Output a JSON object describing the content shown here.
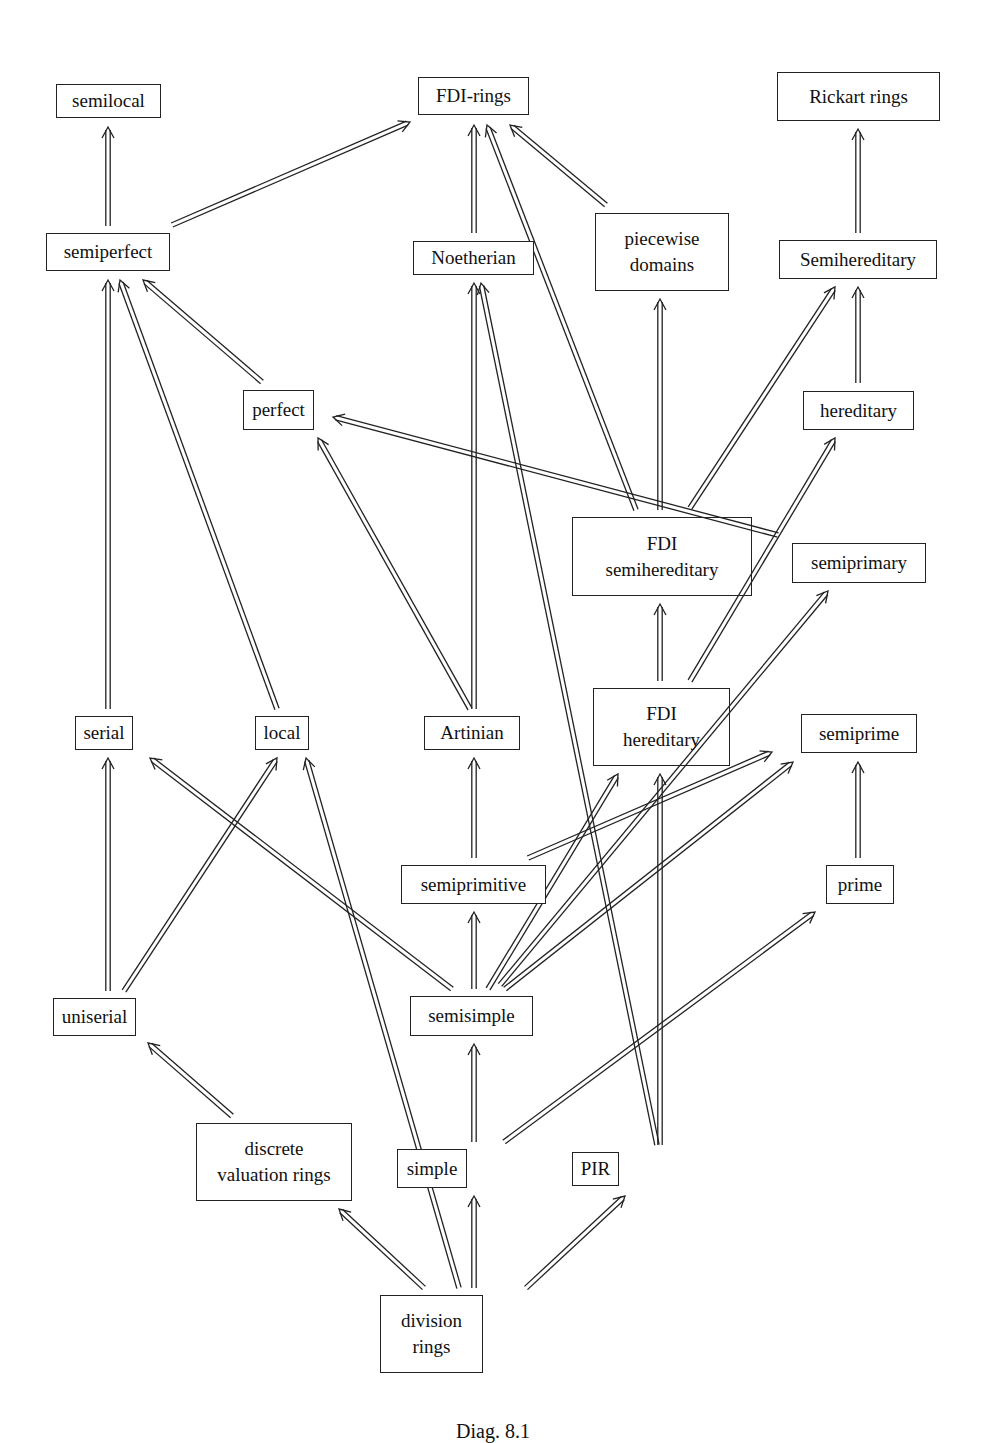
{
  "diagram": {
    "caption": "Diag. 8.1",
    "colors": {
      "stroke": "#222222",
      "background": "#ffffff"
    },
    "nodes": [
      {
        "id": "semilocal",
        "lines": [
          "semilocal"
        ],
        "x": 56,
        "y": 84,
        "w": 105,
        "h": 34
      },
      {
        "id": "fdi_rings",
        "lines": [
          "FDI-rings"
        ],
        "x": 418,
        "y": 77,
        "w": 111,
        "h": 38
      },
      {
        "id": "rickart",
        "lines": [
          "Rickart rings"
        ],
        "x": 777,
        "y": 72,
        "w": 163,
        "h": 49
      },
      {
        "id": "semiperfect",
        "lines": [
          "semiperfect"
        ],
        "x": 46,
        "y": 233,
        "w": 124,
        "h": 38
      },
      {
        "id": "noetherian",
        "lines": [
          "Noetherian"
        ],
        "x": 413,
        "y": 241,
        "w": 121,
        "h": 34
      },
      {
        "id": "piecewise",
        "lines": [
          "piecewise",
          "domains"
        ],
        "x": 595,
        "y": 213,
        "w": 134,
        "h": 78
      },
      {
        "id": "semihereditary",
        "lines": [
          "Semihereditary"
        ],
        "x": 779,
        "y": 240,
        "w": 158,
        "h": 39
      },
      {
        "id": "perfect",
        "lines": [
          "perfect"
        ],
        "x": 243,
        "y": 390,
        "w": 71,
        "h": 40
      },
      {
        "id": "hereditary",
        "lines": [
          "hereditary"
        ],
        "x": 803,
        "y": 391,
        "w": 111,
        "h": 39
      },
      {
        "id": "fdi_semihereditary",
        "lines": [
          "FDI",
          "semihereditary"
        ],
        "x": 572,
        "y": 517,
        "w": 180,
        "h": 79,
        "transparent": true
      },
      {
        "id": "semiprimary",
        "lines": [
          "semiprimary"
        ],
        "x": 792,
        "y": 543,
        "w": 134,
        "h": 40
      },
      {
        "id": "serial",
        "lines": [
          "serial"
        ],
        "x": 75,
        "y": 716,
        "w": 58,
        "h": 34
      },
      {
        "id": "local",
        "lines": [
          "local"
        ],
        "x": 255,
        "y": 716,
        "w": 54,
        "h": 34
      },
      {
        "id": "artinian",
        "lines": [
          "Artinian"
        ],
        "x": 424,
        "y": 716,
        "w": 96,
        "h": 34
      },
      {
        "id": "fdi_hereditary",
        "lines": [
          "FDI",
          "hereditary"
        ],
        "x": 593,
        "y": 688,
        "w": 137,
        "h": 78,
        "transparent": true
      },
      {
        "id": "semiprime",
        "lines": [
          "semiprime"
        ],
        "x": 801,
        "y": 714,
        "w": 116,
        "h": 39
      },
      {
        "id": "semiprimitive",
        "lines": [
          "semiprimitive"
        ],
        "x": 401,
        "y": 865,
        "w": 145,
        "h": 39
      },
      {
        "id": "prime",
        "lines": [
          "prime"
        ],
        "x": 826,
        "y": 865,
        "w": 68,
        "h": 39
      },
      {
        "id": "uniserial",
        "lines": [
          "uniserial"
        ],
        "x": 53,
        "y": 998,
        "w": 83,
        "h": 38
      },
      {
        "id": "semisimple",
        "lines": [
          "semisimple"
        ],
        "x": 410,
        "y": 996,
        "w": 123,
        "h": 40
      },
      {
        "id": "dvr",
        "lines": [
          "discrete",
          "valuation rings"
        ],
        "x": 196,
        "y": 1123,
        "w": 156,
        "h": 78
      },
      {
        "id": "simple",
        "lines": [
          "simple"
        ],
        "x": 397,
        "y": 1149,
        "w": 70,
        "h": 39
      },
      {
        "id": "pir",
        "lines": [
          "PIR"
        ],
        "x": 572,
        "y": 1152,
        "w": 47,
        "h": 34
      },
      {
        "id": "division",
        "lines": [
          "division",
          "rings"
        ],
        "x": 380,
        "y": 1295,
        "w": 103,
        "h": 78
      }
    ],
    "edges": [
      {
        "from": "semiperfect",
        "to": "semilocal",
        "x1": 108,
        "y1": 226,
        "x2": 108,
        "y2": 127
      },
      {
        "from": "semiperfect",
        "to": "fdi_rings",
        "x1": 172,
        "y1": 225,
        "x2": 410,
        "y2": 122
      },
      {
        "from": "noetherian",
        "to": "fdi_rings",
        "x1": 474,
        "y1": 233,
        "x2": 474,
        "y2": 125
      },
      {
        "from": "piecewise",
        "to": "fdi_rings",
        "x1": 606,
        "y1": 205,
        "x2": 510,
        "y2": 125
      },
      {
        "from": "fdi_semihereditary",
        "to": "fdi_rings",
        "x1": 636,
        "y1": 510,
        "x2": 487,
        "y2": 125
      },
      {
        "from": "semihereditary",
        "to": "rickart",
        "x1": 858,
        "y1": 233,
        "x2": 858,
        "y2": 129
      },
      {
        "from": "perfect",
        "to": "semiperfect",
        "x1": 262,
        "y1": 382,
        "x2": 143,
        "y2": 280
      },
      {
        "from": "local",
        "to": "semiperfect",
        "x1": 277,
        "y1": 709,
        "x2": 120,
        "y2": 280
      },
      {
        "from": "serial",
        "to": "semiperfect",
        "x1": 108,
        "y1": 709,
        "x2": 108,
        "y2": 280
      },
      {
        "from": "artinian",
        "to": "noetherian",
        "x1": 474,
        "y1": 709,
        "x2": 474,
        "y2": 283
      },
      {
        "from": "pir",
        "to": "noetherian",
        "x1": 657,
        "y1": 1145,
        "x2": 481,
        "y2": 283
      },
      {
        "from": "fdi_semihereditary",
        "to": "piecewise",
        "x1": 660,
        "y1": 510,
        "x2": 660,
        "y2": 299
      },
      {
        "from": "fdi_semihereditary",
        "to": "semihereditary",
        "x1": 690,
        "y1": 508,
        "x2": 835,
        "y2": 287
      },
      {
        "from": "hereditary",
        "to": "semihereditary",
        "x1": 858,
        "y1": 383,
        "x2": 858,
        "y2": 287
      },
      {
        "from": "semiprimary",
        "to": "perfect",
        "x1": 778,
        "y1": 535,
        "x2": 333,
        "y2": 417
      },
      {
        "from": "artinian",
        "to": "perfect",
        "x1": 470,
        "y1": 709,
        "x2": 318,
        "y2": 438
      },
      {
        "from": "fdi_hereditary",
        "to": "fdi_semihereditary",
        "x1": 660,
        "y1": 681,
        "x2": 660,
        "y2": 604
      },
      {
        "from": "fdi_hereditary",
        "to": "hereditary",
        "x1": 690,
        "y1": 681,
        "x2": 835,
        "y2": 438
      },
      {
        "from": "semisimple",
        "to": "semiprimary",
        "x1": 500,
        "y1": 985,
        "x2": 828,
        "y2": 591
      },
      {
        "from": "semiprimitive",
        "to": "artinian",
        "x1": 474,
        "y1": 858,
        "x2": 474,
        "y2": 758
      },
      {
        "from": "prime",
        "to": "semiprime",
        "x1": 858,
        "y1": 858,
        "x2": 858,
        "y2": 762
      },
      {
        "from": "uniserial",
        "to": "serial",
        "x1": 108,
        "y1": 991,
        "x2": 108,
        "y2": 758
      },
      {
        "from": "uniserial",
        "to": "local",
        "x1": 124,
        "y1": 991,
        "x2": 277,
        "y2": 758
      },
      {
        "from": "semisimple",
        "to": "serial",
        "x1": 452,
        "y1": 989,
        "x2": 150,
        "y2": 758
      },
      {
        "from": "division",
        "to": "local",
        "x1": 459,
        "y1": 1288,
        "x2": 306,
        "y2": 758
      },
      {
        "from": "semiprimitive",
        "to": "semiprime",
        "x1": 528,
        "y1": 858,
        "x2": 772,
        "y2": 752
      },
      {
        "from": "semisimple",
        "to": "fdi_hereditary",
        "x1": 488,
        "y1": 989,
        "x2": 618,
        "y2": 774
      },
      {
        "from": "semisimple",
        "to": "semiprime",
        "x1": 505,
        "y1": 989,
        "x2": 793,
        "y2": 762
      },
      {
        "from": "pir",
        "to": "fdi_hereditary",
        "x1": 660,
        "y1": 1145,
        "x2": 660,
        "y2": 774
      },
      {
        "from": "semisimple",
        "to": "semiprimitive",
        "x1": 474,
        "y1": 989,
        "x2": 474,
        "y2": 912
      },
      {
        "from": "dvr",
        "to": "uniserial",
        "x1": 232,
        "y1": 1116,
        "x2": 148,
        "y2": 1043
      },
      {
        "from": "simple",
        "to": "semisimple",
        "x1": 474,
        "y1": 1142,
        "x2": 474,
        "y2": 1044
      },
      {
        "from": "simple",
        "to": "prime",
        "x1": 504,
        "y1": 1142,
        "x2": 815,
        "y2": 912
      },
      {
        "from": "division",
        "to": "dvr",
        "x1": 424,
        "y1": 1288,
        "x2": 339,
        "y2": 1209
      },
      {
        "from": "division",
        "to": "simple",
        "x1": 474,
        "y1": 1288,
        "x2": 474,
        "y2": 1196
      },
      {
        "from": "division",
        "to": "pir",
        "x1": 526,
        "y1": 1288,
        "x2": 625,
        "y2": 1196
      }
    ]
  }
}
